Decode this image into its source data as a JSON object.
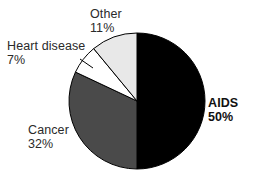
{
  "chart_data": {
    "type": "pie",
    "title": "",
    "subtitle": "",
    "xlabel": "",
    "ylabel": "",
    "legend_position": "none",
    "grid": false,
    "labels_inline": true,
    "start_angle_deg": 0,
    "direction": "clockwise",
    "categories": [
      "AIDS",
      "Cancer",
      "Heart disease",
      "Other"
    ],
    "values": [
      50,
      32,
      7,
      11
    ],
    "value_unit": "percent",
    "slices": [
      {
        "label": "AIDS",
        "percent": 50,
        "percent_text": "50%",
        "color": "#000000",
        "bold_label": true,
        "label_position": "right"
      },
      {
        "label": "Cancer",
        "percent": 32,
        "percent_text": "32%",
        "color": "#4a4a4a",
        "bold_label": false,
        "label_position": "lower-left"
      },
      {
        "label": "Heart disease",
        "percent": 7,
        "percent_text": "7%",
        "color": "#ffffff",
        "bold_label": false,
        "label_position": "upper-left"
      },
      {
        "label": "Other",
        "percent": 11,
        "percent_text": "11%",
        "color": "#e8e8e8",
        "bold_label": false,
        "label_position": "top"
      }
    ]
  },
  "labels": {
    "aids": {
      "name": "AIDS",
      "percent": "50%"
    },
    "cancer": {
      "name": "Cancer",
      "percent": "32%"
    },
    "heart": {
      "name": "Heart disease",
      "percent": "7%"
    },
    "other": {
      "name": "Other",
      "percent": "11%"
    }
  },
  "colors": {
    "background": "#ffffff",
    "outline": "#000000",
    "text": "#2a2a2a",
    "aids": "#000000",
    "cancer": "#4a4a4a",
    "heart": "#ffffff",
    "other": "#e8e8e8"
  }
}
